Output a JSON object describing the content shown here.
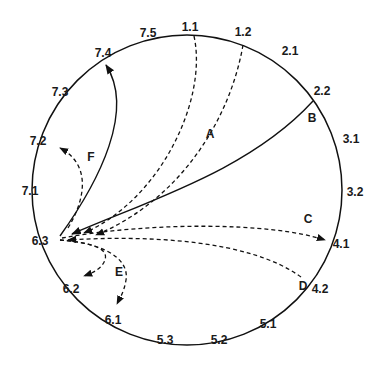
{
  "diagram": {
    "type": "circular-transition-diagram",
    "circle": {
      "cx": 187,
      "cy": 190,
      "r": 155,
      "stroke": "#111111"
    },
    "position_labels": [
      {
        "id": "1.1",
        "text": "1.1",
        "x": 190,
        "y": 31
      },
      {
        "id": "1.2",
        "text": "1.2",
        "x": 243,
        "y": 36
      },
      {
        "id": "2.1",
        "text": "2.1",
        "x": 290,
        "y": 55
      },
      {
        "id": "2.2",
        "text": "2.2",
        "x": 322,
        "y": 95
      },
      {
        "id": "3.1",
        "text": "3.1",
        "x": 351,
        "y": 143
      },
      {
        "id": "3.2",
        "text": "3.2",
        "x": 355,
        "y": 196
      },
      {
        "id": "4.1",
        "text": "4.1",
        "x": 341,
        "y": 248
      },
      {
        "id": "4.2",
        "text": "4.2",
        "x": 320,
        "y": 293
      },
      {
        "id": "5.1",
        "text": "5.1",
        "x": 268,
        "y": 328
      },
      {
        "id": "5.2",
        "text": "5.2",
        "x": 219,
        "y": 344
      },
      {
        "id": "5.3",
        "text": "5.3",
        "x": 165,
        "y": 344
      },
      {
        "id": "6.1",
        "text": "6.1",
        "x": 113,
        "y": 324
      },
      {
        "id": "6.2",
        "text": "6.2",
        "x": 71,
        "y": 293
      },
      {
        "id": "6.3",
        "text": "6.3",
        "x": 40,
        "y": 245
      },
      {
        "id": "7.1",
        "text": "7.1",
        "x": 30,
        "y": 195
      },
      {
        "id": "7.2",
        "text": "7.2",
        "x": 38,
        "y": 145
      },
      {
        "id": "7.3",
        "text": "7.3",
        "x": 60,
        "y": 96
      },
      {
        "id": "7.4",
        "text": "7.4",
        "x": 103,
        "y": 57
      },
      {
        "id": "7.5",
        "text": "7.5",
        "x": 148,
        "y": 37
      }
    ],
    "curve_labels": [
      {
        "id": "A",
        "text": "A",
        "x": 210,
        "y": 138
      },
      {
        "id": "B",
        "text": "B",
        "x": 312,
        "y": 122
      },
      {
        "id": "C",
        "text": "C",
        "x": 308,
        "y": 223
      },
      {
        "id": "D",
        "text": "D",
        "x": 303,
        "y": 290
      },
      {
        "id": "E",
        "text": "E",
        "x": 119,
        "y": 276
      },
      {
        "id": "F",
        "text": "F",
        "x": 91,
        "y": 161
      }
    ],
    "transitions": [
      {
        "label": "A",
        "from": "1.1",
        "to": "6.3",
        "style": "dashed"
      },
      {
        "label": "A",
        "from": "1.2",
        "to": "6.3",
        "style": "dashed"
      },
      {
        "label": "B",
        "from": "2.2",
        "to": "6.3",
        "style": "solid"
      },
      {
        "label": "C",
        "from": "6.3",
        "to": "4.1",
        "style": "dashed"
      },
      {
        "label": "D",
        "from": "4.2",
        "to": "6.3",
        "style": "dashed"
      },
      {
        "label": "E",
        "from": "6.3",
        "to": "6.2",
        "style": "dashed"
      },
      {
        "label": "E",
        "from": "6.3",
        "to": "6.1",
        "style": "dashed"
      },
      {
        "label": "F",
        "from": "6.3",
        "to": "7.2",
        "style": "dashed"
      },
      {
        "label": "",
        "from": "6.3",
        "to": "7.4",
        "style": "solid"
      }
    ]
  }
}
